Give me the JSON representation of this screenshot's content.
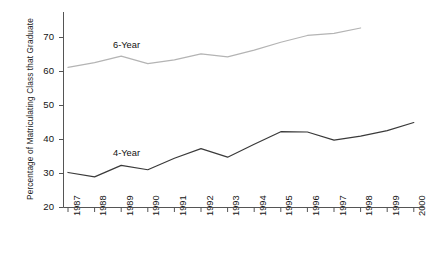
{
  "chart_data": {
    "type": "line",
    "title": "",
    "xlabel": "",
    "ylabel": "Percentage of Matriculating Class that Graduate",
    "categories": [
      "1987",
      "1988",
      "1989",
      "1990",
      "1991",
      "1992",
      "1993",
      "1994",
      "1995",
      "1996",
      "1997",
      "1998",
      "1999",
      "2000"
    ],
    "xlim": [
      1987,
      2000
    ],
    "ylim": [
      20,
      75
    ],
    "yticks": [
      20,
      30,
      40,
      50,
      60,
      70
    ],
    "grid": false,
    "legend": "inline-labels",
    "series": [
      {
        "name": "6-Year",
        "label": "6-Year",
        "color": "#b4b4b4",
        "label_x": 113,
        "label_y": 40,
        "x": [
          "1987",
          "1988",
          "1989",
          "1990",
          "1991",
          "1992",
          "1993",
          "1994",
          "1995",
          "1996",
          "1997",
          "1998"
        ],
        "values": [
          61.2,
          62.6,
          64.5,
          62.3,
          63.4,
          65.2,
          64.3,
          66.3,
          68.6,
          70.6,
          71.2,
          72.8
        ]
      },
      {
        "name": "4-Year",
        "label": "4-Year",
        "color": "#3a3a3a",
        "label_x": 113,
        "label_y": 148,
        "x": [
          "1987",
          "1988",
          "1989",
          "1990",
          "1991",
          "1992",
          "1993",
          "1994",
          "1995",
          "1996",
          "1997",
          "1998",
          "1999",
          "2000"
        ],
        "values": [
          30.3,
          29.0,
          32.4,
          31.1,
          34.5,
          37.3,
          34.8,
          38.6,
          42.3,
          42.2,
          39.8,
          41.0,
          42.6,
          45.0
        ]
      }
    ]
  },
  "axis": {
    "y_tick_labels": [
      "70",
      "60",
      "50",
      "40",
      "30",
      "20"
    ],
    "x_tick_labels": [
      "1987",
      "1988",
      "1989",
      "1990",
      "1991",
      "1992",
      "1993",
      "1994",
      "1995",
      "1996",
      "1997",
      "1998",
      "1999",
      "2000"
    ]
  },
  "colors": {
    "axis": "#555555",
    "series_6year": "#b4b4b4",
    "series_4year": "#3a3a3a",
    "text": "#141414",
    "background": "#ffffff"
  }
}
